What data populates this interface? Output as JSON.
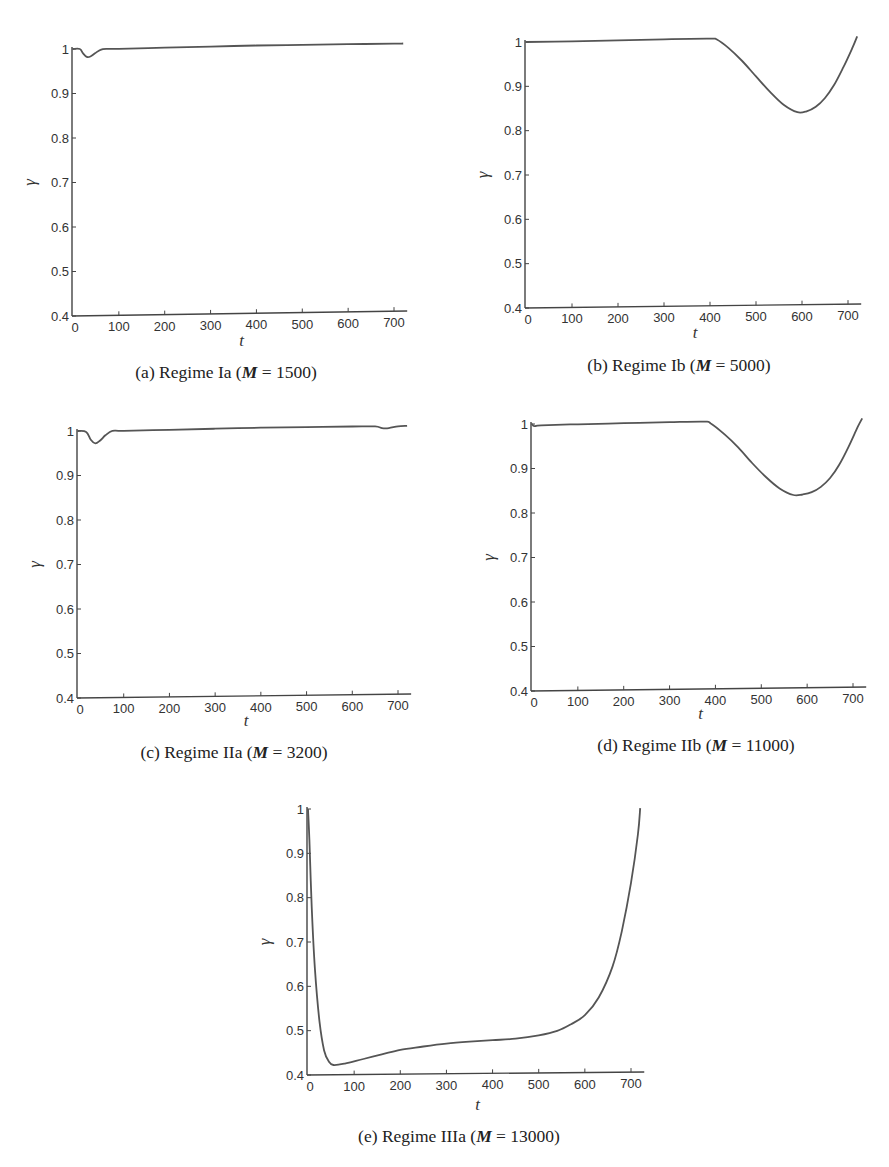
{
  "figure": {
    "panels": [
      {
        "id": "a",
        "caption_prefix": "(a) Regime Ia (",
        "caption_var": "M",
        "caption_eq": " = ",
        "caption_value": "1500",
        "caption_suffix": ")"
      },
      {
        "id": "b",
        "caption_prefix": "(b) Regime Ib (",
        "caption_var": "M",
        "caption_eq": " = ",
        "caption_value": "5000",
        "caption_suffix": ")"
      },
      {
        "id": "c",
        "caption_prefix": "(c) Regime IIa (",
        "caption_var": "M",
        "caption_eq": " = ",
        "caption_value": "3200",
        "caption_suffix": ")"
      },
      {
        "id": "d",
        "caption_prefix": "(d) Regime IIb (",
        "caption_var": "M",
        "caption_eq": " = ",
        "caption_value": "11000",
        "caption_suffix": ")"
      },
      {
        "id": "e",
        "caption_prefix": "(e) Regime IIIa (",
        "caption_var": "M",
        "caption_eq": " = ",
        "caption_value": "13000",
        "caption_suffix": ")"
      }
    ]
  },
  "chart_data": [
    {
      "type": "line",
      "title": "(a) Regime Ia (M = 1500)",
      "xlabel": "t",
      "ylabel": "γ",
      "xlim": [
        0,
        720
      ],
      "ylim": [
        0.4,
        1.0
      ],
      "xticks": [
        0,
        100,
        200,
        300,
        400,
        500,
        600,
        700
      ],
      "yticks": [
        0.4,
        0.5,
        0.6,
        0.7,
        0.8,
        0.9,
        1
      ],
      "grid": false,
      "series": [
        {
          "name": "gamma",
          "x": [
            0,
            15,
            22,
            30,
            38,
            48,
            60,
            75,
            100,
            200,
            300,
            400,
            500,
            600,
            700,
            720
          ],
          "y": [
            1.0,
            1.0,
            0.99,
            0.982,
            0.983,
            0.99,
            0.998,
            1.0,
            1.0,
            1.002,
            1.004,
            1.006,
            1.007,
            1.008,
            1.009,
            1.009
          ]
        }
      ]
    },
    {
      "type": "line",
      "title": "(b) Regime Ib (M = 5000)",
      "xlabel": "t",
      "ylabel": "γ",
      "xlim": [
        0,
        720
      ],
      "ylim": [
        0.4,
        1.0
      ],
      "xticks": [
        0,
        100,
        200,
        300,
        400,
        500,
        600,
        700
      ],
      "yticks": [
        0.4,
        0.5,
        0.6,
        0.7,
        0.8,
        0.9,
        1
      ],
      "grid": false,
      "series": [
        {
          "name": "gamma",
          "x": [
            0,
            100,
            200,
            300,
            400,
            415,
            440,
            470,
            500,
            530,
            560,
            590,
            610,
            630,
            650,
            670,
            690,
            710,
            720
          ],
          "y": [
            1.0,
            1.001,
            1.003,
            1.005,
            1.006,
            1.004,
            0.985,
            0.955,
            0.92,
            0.885,
            0.855,
            0.838,
            0.84,
            0.85,
            0.87,
            0.9,
            0.94,
            0.985,
            1.01
          ]
        }
      ]
    },
    {
      "type": "line",
      "title": "(c) Regime IIa (M = 3200)",
      "xlabel": "t",
      "ylabel": "γ",
      "xlim": [
        0,
        720
      ],
      "ylim": [
        0.4,
        1.0
      ],
      "xticks": [
        0,
        100,
        200,
        300,
        400,
        500,
        600,
        700
      ],
      "yticks": [
        0.4,
        0.5,
        0.6,
        0.7,
        0.8,
        0.9,
        1
      ],
      "grid": false,
      "series": [
        {
          "name": "gamma",
          "x": [
            0,
            18,
            28,
            38,
            48,
            60,
            75,
            100,
            200,
            300,
            400,
            500,
            600,
            650,
            665,
            680,
            700,
            720
          ],
          "y": [
            1.0,
            0.998,
            0.98,
            0.972,
            0.978,
            0.99,
            1.0,
            1.0,
            1.002,
            1.004,
            1.006,
            1.007,
            1.008,
            1.008,
            1.004,
            1.004,
            1.008,
            1.009
          ]
        }
      ]
    },
    {
      "type": "line",
      "title": "(d) Regime IIb (M = 11000)",
      "xlabel": "t",
      "ylabel": "γ",
      "xlim": [
        0,
        720
      ],
      "ylim": [
        0.4,
        1.0
      ],
      "xticks": [
        0,
        100,
        200,
        300,
        400,
        500,
        600,
        700
      ],
      "yticks": [
        0.4,
        0.5,
        0.6,
        0.7,
        0.8,
        0.9,
        1
      ],
      "grid": false,
      "series": [
        {
          "name": "gamma",
          "x": [
            0,
            5,
            20,
            100,
            200,
            300,
            375,
            390,
            420,
            450,
            480,
            510,
            540,
            570,
            590,
            610,
            630,
            650,
            670,
            690,
            710,
            720
          ],
          "y": [
            1.0,
            0.995,
            0.997,
            0.999,
            1.001,
            1.003,
            1.004,
            1.0,
            0.975,
            0.945,
            0.91,
            0.878,
            0.852,
            0.837,
            0.838,
            0.843,
            0.855,
            0.875,
            0.905,
            0.945,
            0.99,
            1.01
          ]
        }
      ]
    },
    {
      "type": "line",
      "title": "(e) Regime IIIa (M = 13000)",
      "xlabel": "t",
      "ylabel": "γ",
      "xlim": [
        0,
        720
      ],
      "ylim": [
        0.4,
        1.0
      ],
      "xticks": [
        0,
        100,
        200,
        300,
        400,
        500,
        600,
        700
      ],
      "yticks": [
        0.4,
        0.5,
        0.6,
        0.7,
        0.8,
        0.9,
        1
      ],
      "grid": false,
      "series": [
        {
          "name": "gamma",
          "x": [
            0,
            3,
            8,
            15,
            25,
            35,
            45,
            55,
            80,
            120,
            160,
            200,
            250,
            300,
            350,
            400,
            450,
            500,
            540,
            570,
            600,
            630,
            660,
            680,
            700,
            715,
            720
          ],
          "y": [
            1.0,
            0.93,
            0.78,
            0.64,
            0.52,
            0.455,
            0.43,
            0.422,
            0.425,
            0.435,
            0.445,
            0.455,
            0.462,
            0.468,
            0.472,
            0.475,
            0.478,
            0.485,
            0.495,
            0.51,
            0.53,
            0.57,
            0.64,
            0.72,
            0.83,
            0.94,
            1.0
          ]
        }
      ]
    }
  ]
}
